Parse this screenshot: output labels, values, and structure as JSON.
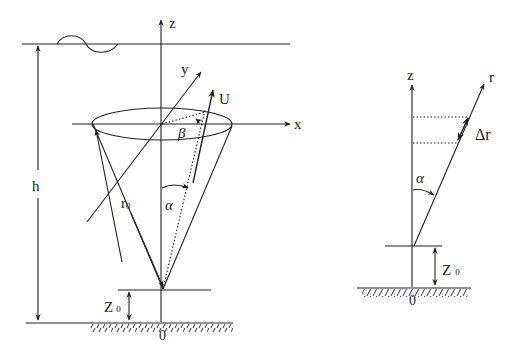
{
  "left_diagram": {
    "axis_z": "z",
    "axis_x": "x",
    "axis_y": "y",
    "velocity": "U",
    "angle_beta": "β",
    "angle_alpha": "α",
    "radius": "r",
    "radius_sub": "0",
    "depth": "h",
    "height": "Z",
    "height_sub": "0",
    "origin": "0"
  },
  "right_diagram": {
    "axis_z": "z",
    "axis_r": "r",
    "increment": "Δr",
    "angle_alpha": "α",
    "height": "Z",
    "height_sub": "0",
    "origin": "0"
  },
  "colors": {
    "ink": "#222222",
    "background": "#ffffff"
  }
}
